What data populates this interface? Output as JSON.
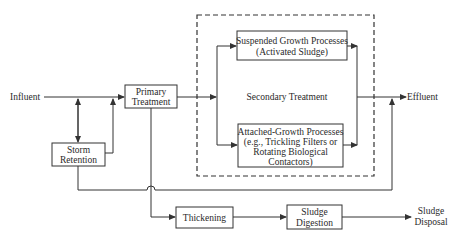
{
  "diagram": {
    "type": "process-flow",
    "nodes": {
      "influent": {
        "label": "Influent"
      },
      "primary": {
        "lines": [
          "Primary",
          "Treatment"
        ]
      },
      "storm": {
        "lines": [
          "Storm",
          "Retention"
        ]
      },
      "secondary": {
        "label": "Secondary Treatment"
      },
      "suspended": {
        "lines": [
          "Suspended Growth Processes",
          "(Activated Sludge)"
        ]
      },
      "attached": {
        "lines": [
          "Attached-Growth Processes",
          "(e.g., Trickling Filters or",
          "Rotating Biological",
          "Contactors)"
        ]
      },
      "effluent": {
        "label": "Effluent"
      },
      "thickening": {
        "label": "Thickening"
      },
      "digestion": {
        "lines": [
          "Sludge",
          "Digestion"
        ]
      },
      "disposal": {
        "lines": [
          "Sludge",
          "Disposal"
        ]
      }
    },
    "edges": [
      {
        "from": "influent",
        "to": "primary"
      },
      {
        "from": "influent",
        "to": "storm",
        "bidirectional": true
      },
      {
        "from": "storm",
        "to": "primary"
      },
      {
        "from": "primary",
        "to": "suspended"
      },
      {
        "from": "primary",
        "to": "attached"
      },
      {
        "from": "suspended",
        "to": "effluent"
      },
      {
        "from": "attached",
        "to": "effluent"
      },
      {
        "from": "storm",
        "to": "effluent"
      },
      {
        "from": "primary",
        "to": "thickening"
      },
      {
        "from": "thickening",
        "to": "digestion"
      },
      {
        "from": "digestion",
        "to": "disposal"
      }
    ]
  }
}
